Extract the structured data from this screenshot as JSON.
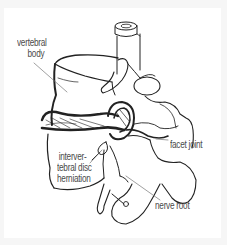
{
  "diagram": {
    "labels": {
      "vertebral_body_line1": "vertebral",
      "vertebral_body_line2": "body",
      "disc_line1": "interver-",
      "disc_line2": "tebral disc",
      "disc_line3": "herniation",
      "facet_joint": "facet joint",
      "nerve_root": "nerve root"
    },
    "colors": {
      "background": "#f6f6f6",
      "canvas": "#ffffff",
      "ink": "#222222",
      "label_text": "#4a4a4a",
      "leader_line": "#777777"
    }
  }
}
